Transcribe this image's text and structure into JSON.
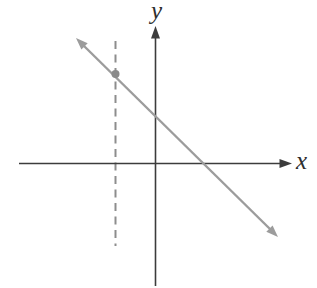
{
  "figure": {
    "axis_labels": {
      "x": "x",
      "y": "y"
    },
    "colors": {
      "background": "#fefefe",
      "axis": "#3c3c3c",
      "line": "#9c9c9c",
      "dashed_line": "#8d8d8d",
      "point": "#8a8a8a",
      "label_text": "#2e2e2e"
    },
    "features": {
      "line_slope_sign": "negative",
      "line_crosses_y_axis": "above origin",
      "line_crosses_x_axis": "right of origin",
      "dashed_line_position": "vertical, left of y-axis",
      "point_position": "intersection of line and dashed vertical line, above x-axis"
    }
  }
}
